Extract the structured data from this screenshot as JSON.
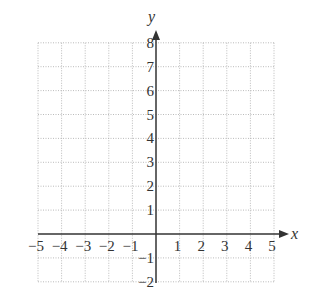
{
  "chart_data": {
    "type": "scatter",
    "title": "",
    "xlabel": "x",
    "ylabel": "y",
    "xlim": [
      -5,
      5
    ],
    "ylim": [
      -2,
      8
    ],
    "grid": true,
    "x_ticks": [
      -5,
      -4,
      -3,
      -2,
      -1,
      1,
      2,
      3,
      4,
      5
    ],
    "y_ticks": [
      -2,
      -1,
      1,
      2,
      3,
      4,
      5,
      6,
      7,
      8
    ],
    "x_tick_labels": [
      "−5",
      "−4",
      "−3",
      "−2",
      "−1",
      "1",
      "2",
      "3",
      "4",
      "5"
    ],
    "y_tick_labels": [
      "−2",
      "−1",
      "1",
      "2",
      "3",
      "4",
      "5",
      "6",
      "7",
      "8"
    ],
    "series": []
  },
  "colors": {
    "axis": "#333333",
    "grid": "#aaaaaa",
    "background": "#ffffff"
  }
}
